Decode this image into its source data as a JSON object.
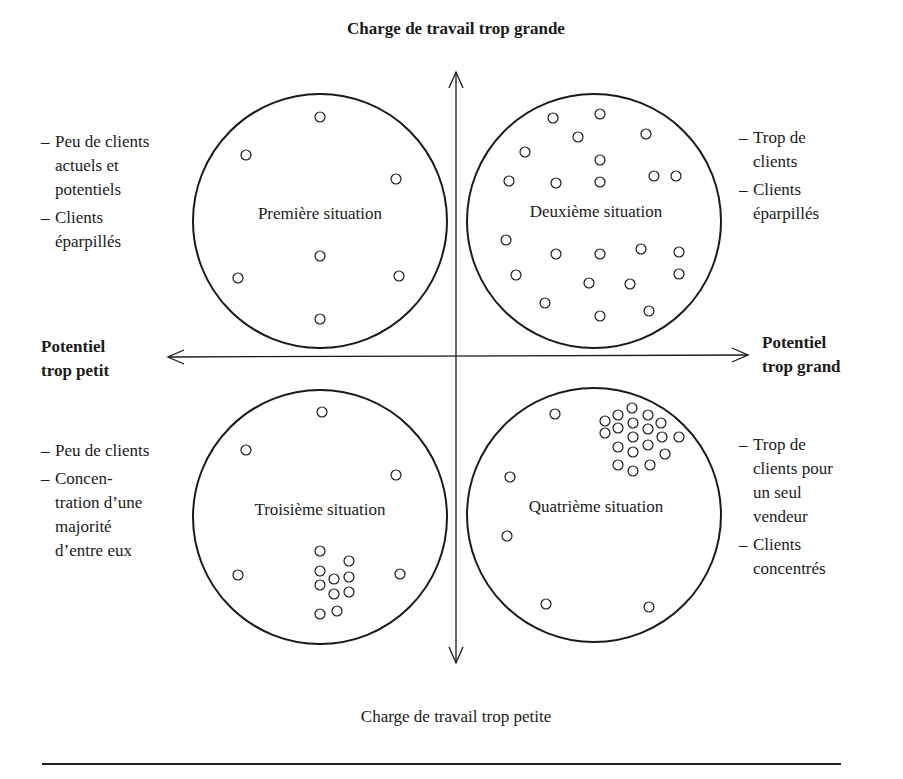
{
  "diagram": {
    "top_label": "Charge de travail trop grande",
    "bottom_label": "Charge de travail trop petite",
    "left_label": [
      "Potentiel",
      "trop petit"
    ],
    "right_label": [
      "Potentiel",
      "trop grand"
    ],
    "quadrants": [
      {
        "position": "top-left",
        "title": "Première situation",
        "notes": [
          {
            "dash": "–",
            "lines": [
              "Peu de clients",
              "actuels et",
              "potentiels"
            ]
          },
          {
            "dash": "–",
            "lines": [
              "Clients",
              "éparpillés"
            ]
          }
        ],
        "circle": {
          "cx": 320,
          "cy": 221,
          "r": 127
        },
        "dots": [
          [
            320,
            117
          ],
          [
            246,
            155
          ],
          [
            396,
            179
          ],
          [
            320,
            256
          ],
          [
            238,
            278
          ],
          [
            399,
            276
          ],
          [
            320,
            319
          ]
        ]
      },
      {
        "position": "top-right",
        "title": "Deuxième situation",
        "notes": [
          {
            "dash": "–",
            "lines": [
              "Trop de",
              "clients"
            ]
          },
          {
            "dash": "–",
            "lines": [
              "Clients",
              "éparpillés"
            ]
          }
        ],
        "circle": {
          "cx": 594,
          "cy": 221,
          "r": 127
        },
        "dots": [
          [
            553,
            118
          ],
          [
            600,
            114
          ],
          [
            578,
            137
          ],
          [
            646,
            134
          ],
          [
            525,
            152
          ],
          [
            600,
            160
          ],
          [
            509,
            181
          ],
          [
            556,
            183
          ],
          [
            600,
            182
          ],
          [
            654,
            176
          ],
          [
            676,
            176
          ],
          [
            506,
            240
          ],
          [
            556,
            254
          ],
          [
            600,
            254
          ],
          [
            641,
            249
          ],
          [
            679,
            252
          ],
          [
            516,
            275
          ],
          [
            589,
            283
          ],
          [
            630,
            284
          ],
          [
            679,
            274
          ],
          [
            545,
            303
          ],
          [
            600,
            316
          ],
          [
            649,
            311
          ]
        ]
      },
      {
        "position": "bottom-left",
        "title": "Troisième situation",
        "notes": [
          {
            "dash": "–",
            "lines": [
              "Peu de clients"
            ]
          },
          {
            "dash": "–",
            "lines": [
              "Concen-",
              "tration d’une",
              "majorité",
              "d’entre eux"
            ]
          }
        ],
        "circle": {
          "cx": 320,
          "cy": 517,
          "r": 127
        },
        "dots": [
          [
            322,
            412
          ],
          [
            246,
            450
          ],
          [
            396,
            475
          ],
          [
            238,
            575
          ],
          [
            400,
            574
          ],
          [
            320,
            551
          ],
          [
            349,
            561
          ],
          [
            320,
            571
          ],
          [
            334,
            579
          ],
          [
            349,
            577
          ],
          [
            320,
            585
          ],
          [
            334,
            594
          ],
          [
            349,
            592
          ],
          [
            320,
            614
          ],
          [
            337,
            611
          ]
        ]
      },
      {
        "position": "bottom-right",
        "title": "Quatrième situation",
        "notes": [
          {
            "dash": "–",
            "lines": [
              "Trop de",
              "clients pour",
              "un seul",
              "vendeur"
            ]
          },
          {
            "dash": "–",
            "lines": [
              "Clients",
              "concentrés"
            ]
          }
        ],
        "circle": {
          "cx": 594,
          "cy": 515,
          "r": 127
        },
        "dots": [
          [
            555,
            414
          ],
          [
            510,
            477
          ],
          [
            507,
            536
          ],
          [
            546,
            604
          ],
          [
            649,
            607
          ],
          [
            632,
            408
          ],
          [
            618,
            415
          ],
          [
            648,
            415
          ],
          [
            605,
            421
          ],
          [
            633,
            423
          ],
          [
            661,
            423
          ],
          [
            618,
            428
          ],
          [
            648,
            429
          ],
          [
            605,
            433
          ],
          [
            633,
            437
          ],
          [
            662,
            437
          ],
          [
            679,
            437
          ],
          [
            618,
            447
          ],
          [
            648,
            445
          ],
          [
            633,
            452
          ],
          [
            665,
            454
          ],
          [
            618,
            465
          ],
          [
            650,
            465
          ],
          [
            633,
            471
          ]
        ]
      }
    ],
    "colors": {
      "ink": "#1a1a1a",
      "background": "#ffffff"
    }
  }
}
